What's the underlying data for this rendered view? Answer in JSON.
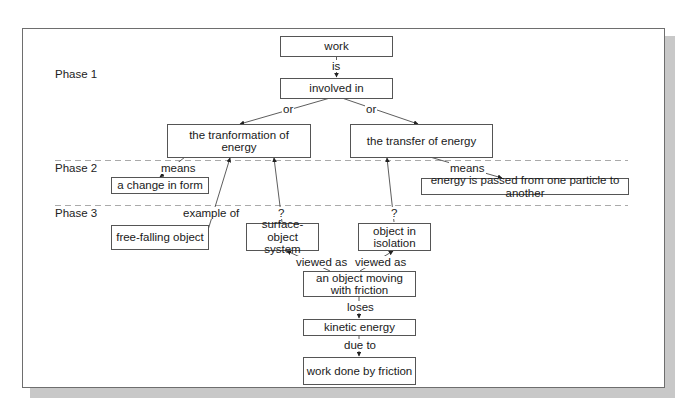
{
  "diagram": {
    "type": "concept-map",
    "phases": [
      {
        "label": "Phase 1"
      },
      {
        "label": "Phase 2"
      },
      {
        "label": "Phase 3"
      }
    ],
    "nodes": {
      "work": "work",
      "involved_in": "involved in",
      "transformation": "the tranformation of energy",
      "transfer": "the transfer of energy",
      "change_in_form": "a change in form",
      "energy_passed": "energy is passed from one particle to another",
      "free_falling": "free-falling object",
      "surface_object": "surface-object system",
      "isolation": "object in isolation",
      "moving_friction": "an object moving with friction",
      "kinetic_energy": "kinetic energy",
      "work_done_friction": "work done by friction"
    },
    "edges": [
      {
        "from": "work",
        "to": "involved_in",
        "label": "is"
      },
      {
        "from": "involved_in",
        "to": "transformation",
        "label": "or"
      },
      {
        "from": "involved_in",
        "to": "transfer",
        "label": "or"
      },
      {
        "from": "transformation",
        "to": "change_in_form",
        "label": "means"
      },
      {
        "from": "transfer",
        "to": "energy_passed",
        "label": "means"
      },
      {
        "from": "free_falling",
        "to": "transformation",
        "label": "example of"
      },
      {
        "from": "surface_object",
        "to": "transformation",
        "label": "?"
      },
      {
        "from": "isolation",
        "to": "transfer",
        "label": "?"
      },
      {
        "from": "moving_friction",
        "to": "surface_object",
        "label": "viewed as"
      },
      {
        "from": "moving_friction",
        "to": "isolation",
        "label": "viewed as"
      },
      {
        "from": "moving_friction",
        "to": "kinetic_energy",
        "label": "loses"
      },
      {
        "from": "kinetic_energy",
        "to": "work_done_friction",
        "label": "due to"
      }
    ],
    "labels": {
      "is": "is",
      "or_left": "or",
      "or_right": "or",
      "means_left": "means",
      "means_right": "means",
      "example_of": "example of",
      "q_left": "?",
      "q_right": "?",
      "viewed_as_left": "viewed as",
      "viewed_as_right": "viewed as",
      "loses": "loses",
      "due_to": "due to"
    }
  }
}
